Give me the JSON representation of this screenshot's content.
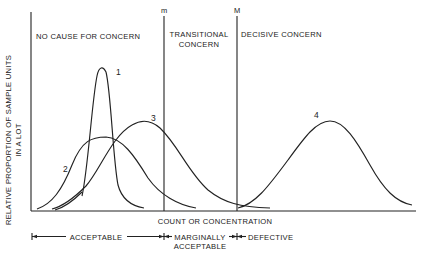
{
  "diagram": {
    "y_axis_label_line1": "RELATIVE PROPORTION OF SAMPLE UNITS",
    "y_axis_label_line2": "IN A LOT",
    "x_axis_label": "COUNT OR CONCENTRATION",
    "thresholds": [
      {
        "label": "m"
      },
      {
        "label": "M"
      }
    ],
    "regions": [
      {
        "label": "NO CAUSE FOR CONCERN"
      },
      {
        "label_line1": "TRANSITIONAL",
        "label_line2": "CONCERN"
      },
      {
        "label": "DECISIVE CONCERN"
      }
    ],
    "curves": [
      {
        "label": "1",
        "description": "narrow, tall distribution centered well below m"
      },
      {
        "label": "2",
        "description": "broad, low distribution centered below m"
      },
      {
        "label": "3",
        "description": "broad distribution centered near m, tail past M"
      },
      {
        "label": "4",
        "description": "broad distribution centered far above M"
      }
    ],
    "classes": [
      {
        "label": "ACCEPTABLE"
      },
      {
        "label_line1": "MARGINALLY",
        "label_line2": "ACCEPTABLE"
      },
      {
        "label": "DEFECTIVE"
      }
    ]
  }
}
